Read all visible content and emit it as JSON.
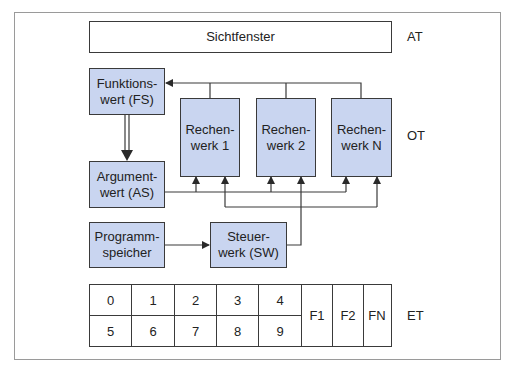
{
  "layers": {
    "at": "AT",
    "ot": "OT",
    "et": "ET"
  },
  "display": {
    "label": "Sichtfenster"
  },
  "function_register": {
    "line1": "Funktions-",
    "line2": "wert (FS)"
  },
  "argument_register": {
    "line1": "Argument-",
    "line2": "wert (AS)"
  },
  "program_memory": {
    "line1": "Programm-",
    "line2": "speicher"
  },
  "control_unit": {
    "line1": "Steuer-",
    "line2": "werk (SW)"
  },
  "alus": [
    {
      "line1": "Rechen-",
      "line2": "werk 1"
    },
    {
      "line1": "Rechen-",
      "line2": "werk 2"
    },
    {
      "line1": "Rechen-",
      "line2": "werk N"
    }
  ],
  "keypad": {
    "digits_row1": [
      "0",
      "1",
      "2",
      "3",
      "4"
    ],
    "digits_row2": [
      "5",
      "6",
      "7",
      "8",
      "9"
    ],
    "function_keys": [
      "F1",
      "F2",
      "FN"
    ]
  },
  "colors": {
    "box_fill": "#c9d5f0",
    "line": "#3a3a3a",
    "frame": "#9a9a9a"
  }
}
